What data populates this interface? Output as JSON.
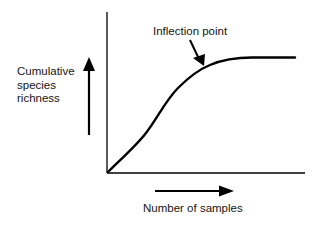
{
  "diagram": {
    "type": "species-accumulation-curve",
    "annotation": {
      "label": "Inflection point",
      "points_to": "curve-bend"
    },
    "y_axis": {
      "label_lines": [
        "Cumulative",
        "species",
        "richness"
      ],
      "direction": "increasing-up"
    },
    "x_axis": {
      "label": "Number of samples",
      "direction": "increasing-right"
    },
    "curve": {
      "shape": "sigmoid-saturating",
      "description": "Rises roughly linearly from origin, bends at the inflection point, then levels off to a plateau"
    },
    "colors": {
      "line": "#000000",
      "text": "#141414",
      "background": "#ffffff"
    }
  }
}
